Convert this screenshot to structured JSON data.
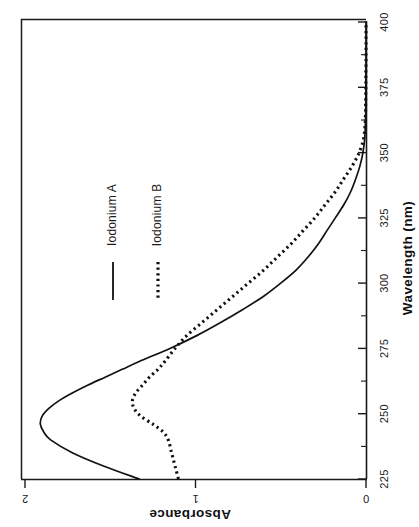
{
  "figure": {
    "background_color": "#ffffff",
    "ink_color": "#111111",
    "orientation_note": "rotated-90-ccw"
  },
  "chart_data": {
    "type": "line",
    "title": "",
    "subtitle": "",
    "xlabel": "Wavelength  (nm)",
    "ylabel": "Absorbance",
    "xlim": [
      225,
      400
    ],
    "ylim": [
      0,
      2
    ],
    "xticks": [
      225,
      250,
      275,
      300,
      325,
      350,
      375,
      400
    ],
    "xticklabels": [
      "225",
      "250",
      "275",
      "300",
      "325",
      "350",
      "375",
      "400"
    ],
    "yticks": [
      0,
      1,
      2
    ],
    "yticklabels": [
      "0",
      "1",
      "2"
    ],
    "x_minor_tick_interval": 12.5,
    "grid": false,
    "legend_position": "upper-middle",
    "x": [
      225,
      230,
      235,
      240,
      243,
      246,
      249,
      252,
      255,
      258,
      261,
      264,
      267,
      270,
      275,
      280,
      285,
      290,
      295,
      300,
      305,
      310,
      315,
      320,
      325,
      330,
      335,
      340,
      345,
      350,
      355,
      360,
      365,
      370,
      375,
      380,
      385,
      390,
      395,
      400
    ],
    "series": [
      {
        "name": "Iodonium A",
        "style": "solid",
        "color": "#111111",
        "values": [
          1.33,
          1.54,
          1.72,
          1.85,
          1.89,
          1.91,
          1.9,
          1.86,
          1.8,
          1.72,
          1.63,
          1.53,
          1.43,
          1.33,
          1.15,
          0.99,
          0.85,
          0.72,
          0.6,
          0.5,
          0.41,
          0.34,
          0.28,
          0.23,
          0.18,
          0.13,
          0.09,
          0.06,
          0.035,
          0.018,
          0.008,
          0.004,
          0.002,
          0.001,
          0.001,
          0.001,
          0.0,
          0.0,
          0.0,
          0.0
        ]
      },
      {
        "name": "Iodonium B",
        "style": "dotted",
        "color": "#111111",
        "values": [
          1.1,
          1.12,
          1.14,
          1.16,
          1.19,
          1.25,
          1.32,
          1.36,
          1.37,
          1.35,
          1.31,
          1.27,
          1.22,
          1.18,
          1.12,
          1.05,
          0.96,
          0.87,
          0.78,
          0.69,
          0.6,
          0.52,
          0.44,
          0.37,
          0.3,
          0.24,
          0.18,
          0.13,
          0.08,
          0.04,
          0.015,
          0.006,
          0.003,
          0.002,
          0.001,
          0.001,
          0.0,
          0.0,
          0.0,
          0.0
        ]
      }
    ],
    "notes": [
      "Iodonium A peaks near 246-249 nm at about 1.90 absorbance",
      "Iodonium B has a broad maximum near 253-255 nm at about 1.37 absorbance with a shoulder near 235 nm",
      "Both traces decay to baseline near 355-360 nm"
    ]
  },
  "legend": {
    "entries": [
      {
        "label": "Iodonium A",
        "style": "solid"
      },
      {
        "label": "Iodonium B",
        "style": "dotted"
      }
    ]
  },
  "axes": {
    "x_title": "Wavelength  (nm)",
    "y_title": "Absorbance",
    "x_tick_0": "225",
    "x_tick_1": "250",
    "x_tick_2": "275",
    "x_tick_3": "300",
    "x_tick_4": "325",
    "x_tick_5": "350",
    "x_tick_6": "375",
    "x_tick_7": "400",
    "y_tick_0": "0",
    "y_tick_1": "1",
    "y_tick_2": "2"
  }
}
